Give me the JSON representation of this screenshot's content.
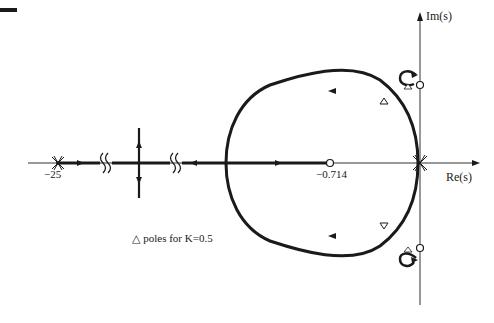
{
  "figure": {
    "type": "root-locus",
    "axes": {
      "x_label": "Re(s)",
      "y_label": "Im(s)"
    },
    "labels": {
      "pole_far": "−25",
      "zero_real": "−0.714",
      "legend": "△ poles for K=0.5"
    },
    "markers": {
      "poles": [
        {
          "re": -25,
          "im": 0,
          "symbol": "x",
          "multiplicity": 2
        },
        {
          "re": 0,
          "im": 0,
          "symbol": "x",
          "multiplicity": 4
        }
      ],
      "zeros": [
        {
          "re": -0.714,
          "im": 0,
          "symbol": "o"
        },
        {
          "re": 0,
          "im": "+j",
          "symbol": "o"
        },
        {
          "re": 0,
          "im": "-j",
          "symbol": "o"
        }
      ],
      "k_0_5_poles_symbol": "triangle"
    },
    "break_marks": [
      "axis-break-left",
      "axis-break-right"
    ],
    "colors": {
      "ink": "#1a1a1a",
      "background": "#ffffff"
    }
  }
}
